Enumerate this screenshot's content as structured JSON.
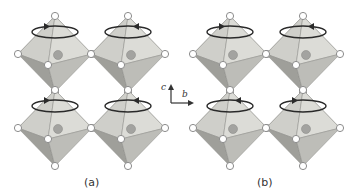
{
  "figure": {
    "panels": [
      {
        "id": "a",
        "label": "(a)",
        "label_pos": [
          92,
          183
        ],
        "octahedra": [
          {
            "cx": 55,
            "cy": 54,
            "rotation": "counterclockwise",
            "arrow_side": "left"
          },
          {
            "cx": 128,
            "cy": 54,
            "rotation": "clockwise",
            "arrow_side": "right"
          },
          {
            "cx": 55,
            "cy": 128,
            "rotation": "counterclockwise",
            "arrow_side": "left"
          },
          {
            "cx": 128,
            "cy": 128,
            "rotation": "clockwise",
            "arrow_side": "right"
          }
        ]
      },
      {
        "id": "b",
        "label": "(b)",
        "label_pos": [
          265,
          183
        ],
        "octahedra": [
          {
            "cx": 230,
            "cy": 54,
            "rotation": "counterclockwise",
            "arrow_side": "left"
          },
          {
            "cx": 303,
            "cy": 54,
            "rotation": "clockwise",
            "arrow_side": "right"
          },
          {
            "cx": 230,
            "cy": 128,
            "rotation": "clockwise",
            "arrow_side": "right"
          },
          {
            "cx": 303,
            "cy": 128,
            "rotation": "counterclockwise",
            "arrow_side": "left"
          }
        ]
      }
    ],
    "axes": {
      "origin": [
        171,
        103
      ],
      "c_label": "c",
      "b_label": "b",
      "c_tip": [
        171,
        84
      ],
      "b_tip": [
        194,
        103
      ]
    },
    "colors": {
      "face_light": "#d9d9d4",
      "face_mid": "#bdbdb8",
      "face_dark": "#9f9f9a",
      "edge": "#8a8a86",
      "atom_fill": "#ffffff",
      "atom_stroke": "#8c8c8c",
      "center_atom": "#a3a3a0",
      "arrow": "#2a2a2a",
      "axis": "#333333"
    }
  }
}
